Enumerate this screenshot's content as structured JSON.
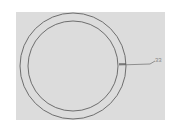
{
  "diagram": {
    "type": "concentric-circles",
    "background_color": "#dcdcdc",
    "stroke_color": "#6e6e6e",
    "outer_circle": {
      "cx": 73,
      "cy": 66,
      "r": 53
    },
    "inner_circle": {
      "cx": 73,
      "cy": 66,
      "r": 45
    },
    "leader_line": {
      "x1": 119,
      "y1": 65,
      "x2": 155,
      "y2": 61
    },
    "callout_label": "33"
  }
}
